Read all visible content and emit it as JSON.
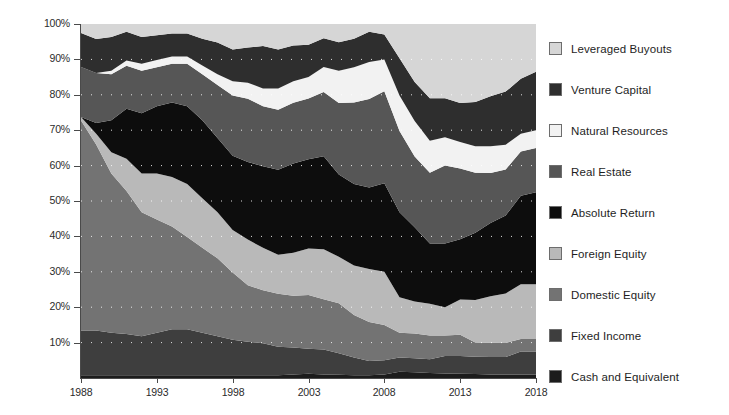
{
  "chart_data": {
    "type": "area",
    "title": "",
    "subtitle": "",
    "xlabel": "",
    "ylabel": "",
    "stacked": true,
    "normalized": true,
    "grid": "dotted-horizontal",
    "legend_position": "right",
    "xlim": [
      1988,
      2018
    ],
    "ylim": [
      0,
      100
    ],
    "x_tick_labels": [
      "1988",
      "1993",
      "1998",
      "2003",
      "2008",
      "2013",
      "2018"
    ],
    "x_ticks": [
      1988,
      1993,
      1998,
      2003,
      2008,
      2013,
      2018
    ],
    "y_tick_labels": [
      "10%",
      "20%",
      "30%",
      "40%",
      "50%",
      "60%",
      "70%",
      "80%",
      "90%",
      "100%"
    ],
    "y_ticks": [
      10,
      20,
      30,
      40,
      50,
      60,
      70,
      80,
      90,
      100
    ],
    "x": [
      1988,
      1989,
      1990,
      1991,
      1992,
      1993,
      1994,
      1995,
      1996,
      1997,
      1998,
      1999,
      2000,
      2001,
      2002,
      2003,
      2004,
      2005,
      2006,
      2007,
      2008,
      2009,
      2010,
      2011,
      2012,
      2013,
      2014,
      2015,
      2016,
      2017,
      2018
    ],
    "series": [
      {
        "name": "Cash and Equivalent",
        "color": "#1c1c1c",
        "values": [
          0.8,
          0.8,
          0.8,
          0.8,
          0.8,
          0.8,
          0.8,
          0.8,
          0.8,
          0.8,
          0.8,
          0.8,
          0.8,
          0.8,
          1.0,
          1.2,
          1.0,
          0.9,
          0.8,
          0.8,
          1.0,
          1.8,
          1.6,
          1.4,
          1.3,
          1.2,
          1.1,
          1.0,
          1.0,
          1.0,
          1.0
        ]
      },
      {
        "name": "Fixed Income",
        "color": "#3e3e3e",
        "values": [
          12.5,
          12.5,
          12.0,
          11.5,
          11.0,
          12.0,
          13.0,
          13.0,
          12.0,
          11.0,
          10.0,
          9.5,
          9.0,
          8.0,
          7.5,
          7.0,
          7.0,
          6.0,
          5.0,
          4.0,
          4.0,
          4.0,
          4.0,
          3.9,
          4.9,
          5.0,
          4.9,
          4.9,
          4.9,
          6.5,
          6.5
        ]
      },
      {
        "name": "Domestic Equity",
        "color": "#737373"
      },
      {
        "name": "Foreign Equity",
        "color": "#b9b9b9"
      },
      {
        "name": "Absolute Return",
        "color": "#0d0d0d"
      },
      {
        "name": "Real Estate",
        "color": "#565656"
      },
      {
        "name": "Natural Resources",
        "color": "#f2f2f2"
      },
      {
        "name": "Venture Capital",
        "color": "#2e2e2e"
      },
      {
        "name": "Leveraged Buyouts",
        "color": "#d6d6d6"
      }
    ],
    "series_values": {
      "Cash and Equivalent": [
        0.8,
        0.8,
        0.8,
        0.8,
        0.8,
        0.8,
        0.8,
        0.8,
        0.8,
        0.8,
        0.8,
        0.8,
        0.8,
        0.8,
        1.0,
        1.2,
        1.0,
        0.9,
        0.8,
        0.8,
        1.0,
        1.8,
        1.6,
        1.4,
        1.3,
        1.2,
        1.1,
        1.0,
        1.0,
        1.0,
        1.0
      ],
      "Fixed Income": [
        12.5,
        12.5,
        12.0,
        11.5,
        11.0,
        12.0,
        13.0,
        13.0,
        12.0,
        11.0,
        10.0,
        9.5,
        9.0,
        8.0,
        7.5,
        7.0,
        7.0,
        6.0,
        5.0,
        4.0,
        4.0,
        4.0,
        4.0,
        3.9,
        4.9,
        5.0,
        4.9,
        4.9,
        4.9,
        6.5,
        6.5
      ],
      "Domestic Equity": [
        58.7,
        52.0,
        45.0,
        40.0,
        35.0,
        32.0,
        29.0,
        26.0,
        24.0,
        22.0,
        19.0,
        16.0,
        15.0,
        15.0,
        14.5,
        15.0,
        14.0,
        14.0,
        12.0,
        11.0,
        10.0,
        7.0,
        7.0,
        6.7,
        5.8,
        6.0,
        4.0,
        4.0,
        4.0,
        3.5,
        3.5
      ],
      "Foreign Equity": [
        1.0,
        3.0,
        6.0,
        9.0,
        11.0,
        13.0,
        14.0,
        15.0,
        14.0,
        13.0,
        12.0,
        13.0,
        12.0,
        11.0,
        12.0,
        13.0,
        14.0,
        13.0,
        14.0,
        15.0,
        15.0,
        10.0,
        9.0,
        9.0,
        8.0,
        10.0,
        12.0,
        13.0,
        14.0,
        15.5,
        15.5
      ],
      "Absolute Return": [
        0.0,
        3.0,
        9.0,
        14.0,
        17.0,
        19.0,
        21.0,
        22.0,
        22.0,
        21.0,
        21.0,
        22.0,
        23.0,
        24.0,
        25.0,
        25.0,
        26.0,
        23.0,
        23.0,
        23.0,
        25.0,
        24.0,
        21.0,
        17.0,
        18.0,
        17.0,
        19.0,
        20.5,
        22.0,
        25.0,
        26.0
      ],
      "Real Estate": [
        14.0,
        14.0,
        13.0,
        12.0,
        12.0,
        11.0,
        11.0,
        12.0,
        13.0,
        15.0,
        17.0,
        18.0,
        17.0,
        17.0,
        17.0,
        17.0,
        18.0,
        20.0,
        23.0,
        25.0,
        26.0,
        23.0,
        20.0,
        20.0,
        22.0,
        20.0,
        17.0,
        14.0,
        13.0,
        12.5,
        12.5
      ],
      "Natural Resources": [
        0.0,
        0.0,
        1.0,
        1.5,
        2.0,
        2.0,
        2.0,
        2.0,
        2.5,
        3.0,
        4.0,
        4.5,
        5.0,
        6.0,
        6.0,
        6.0,
        7.0,
        9.0,
        10.0,
        10.5,
        9.0,
        10.0,
        10.0,
        9.0,
        8.0,
        7.5,
        7.5,
        7.5,
        7.0,
        5.0,
        5.0
      ],
      "Venture Capital": [
        9.5,
        9.5,
        9.5,
        8.0,
        7.5,
        7.0,
        6.5,
        6.5,
        7.5,
        9.0,
        9.0,
        10.0,
        12.0,
        11.0,
        10.0,
        9.0,
        8.0,
        8.0,
        8.0,
        8.5,
        7.0,
        10.5,
        11.0,
        12.0,
        11.0,
        11.0,
        12.5,
        14.0,
        15.0,
        15.5,
        16.5
      ],
      "Leveraged Buyouts": [
        2.5,
        4.2,
        3.7,
        2.2,
        3.7,
        3.2,
        2.7,
        2.7,
        4.2,
        5.2,
        7.2,
        6.7,
        6.2,
        7.2,
        6.0,
        5.8,
        4.0,
        5.1,
        4.2,
        2.2,
        3.0,
        9.7,
        16.4,
        21.0,
        21.0,
        22.3,
        22.0,
        20.2,
        19.1,
        15.5,
        13.5
      ]
    }
  },
  "axes": {
    "y_labels": [
      "100%",
      "90%",
      "80%",
      "70%",
      "60%",
      "50%",
      "40%",
      "30%",
      "20%",
      "10%"
    ],
    "x_labels": [
      "1988",
      "1993",
      "1998",
      "2003",
      "2008",
      "2013",
      "2018"
    ]
  },
  "legend": {
    "items": [
      {
        "label": "Leveraged Buyouts",
        "swatch": "#d6d6d6"
      },
      {
        "label": "Venture Capital",
        "swatch": "#2e2e2e"
      },
      {
        "label": "Natural Resources",
        "swatch": "#f2f2f2"
      },
      {
        "label": "Real Estate",
        "swatch": "#565656"
      },
      {
        "label": "Absolute Return",
        "swatch": "#0d0d0d"
      },
      {
        "label": "Foreign Equity",
        "swatch": "#b9b9b9"
      },
      {
        "label": "Domestic Equity",
        "swatch": "#737373"
      },
      {
        "label": "Fixed Income",
        "swatch": "#3e3e3e"
      },
      {
        "label": "Cash and Equivalent",
        "swatch": "#1c1c1c"
      }
    ]
  }
}
